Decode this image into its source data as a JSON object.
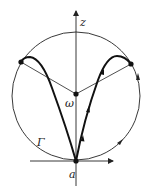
{
  "diagram": {
    "labels": {
      "z_axis": "z",
      "omega_point": "ω",
      "a_point": "a",
      "contour": "Γ"
    },
    "colors": {
      "stroke": "#222222",
      "background": "#ffffff"
    },
    "elements": {
      "circle": "Γ contour circle through a",
      "axes": [
        "vertical z-axis",
        "horizontal axis through a"
      ],
      "points": [
        "a",
        "ω",
        "left upper point",
        "right upper point"
      ],
      "curves": [
        "thick path from a to left upper point",
        "thick path from a to right upper point"
      ],
      "arrows": "direction markers on right arc and right thick curve"
    }
  }
}
